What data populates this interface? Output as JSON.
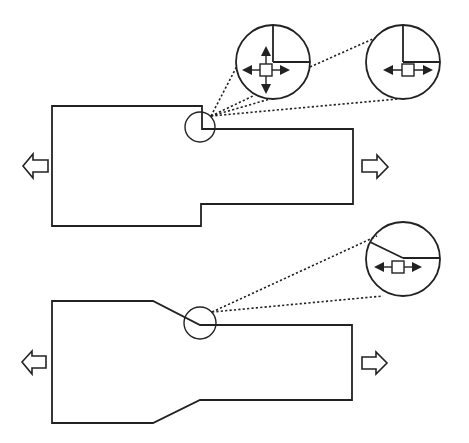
{
  "figure": {
    "colors": {
      "line": "#222222",
      "background": "#ffffff"
    },
    "panels": [
      {
        "id": "top",
        "specimen_shape": "stepped-rectangle",
        "load_arrows": [
          "left",
          "right"
        ],
        "detail_circles": [
          {
            "id": "top-detail-biaxial",
            "junction": "right-angle",
            "arrows": [
              "up",
              "down",
              "left",
              "right"
            ]
          },
          {
            "id": "top-detail-uniaxial",
            "junction": "right-angle",
            "arrows": [
              "left",
              "right"
            ]
          }
        ]
      },
      {
        "id": "bottom",
        "specimen_shape": "tapered-rectangle",
        "load_arrows": [
          "left",
          "right"
        ],
        "detail_circles": [
          {
            "id": "bottom-detail-uniaxial",
            "junction": "sloped",
            "arrows": [
              "left",
              "right"
            ]
          }
        ]
      }
    ]
  }
}
